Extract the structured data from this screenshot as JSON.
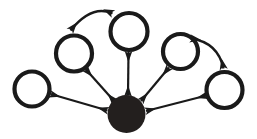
{
  "diagram": {
    "type": "node-link-diagram",
    "canvas": {
      "width": 257,
      "height": 139,
      "background": "#ffffff"
    },
    "style": {
      "ink_color": "#1a1a1a",
      "ring_stroke_width": 4.2,
      "edge_stroke_width": 2.2,
      "curve_stroke_width": 2.4,
      "arrowhead_length": 7,
      "arrowhead_width": 6
    },
    "nodes": [
      {
        "id": "hub",
        "label": "",
        "kind": "filled",
        "fill": "#231f1e",
        "cx": 126.5,
        "cy": 114.0,
        "r": 19.0
      },
      {
        "id": "node-far-left",
        "label": "",
        "kind": "ring",
        "stroke": "#1a1a1a",
        "cx": 32.0,
        "cy": 89.0,
        "r": 17.5
      },
      {
        "id": "node-upper-left",
        "label": "",
        "kind": "ring",
        "stroke": "#1a1a1a",
        "cx": 74.0,
        "cy": 53.5,
        "r": 18.0
      },
      {
        "id": "node-top-center",
        "label": "",
        "kind": "ring",
        "stroke": "#1a1a1a",
        "cx": 129.0,
        "cy": 31.5,
        "r": 18.5
      },
      {
        "id": "node-upper-right",
        "label": "",
        "kind": "ring",
        "stroke": "#1a1a1a",
        "cx": 180.5,
        "cy": 51.5,
        "r": 17.5
      },
      {
        "id": "node-far-right",
        "label": "",
        "kind": "ring",
        "stroke": "#1a1a1a",
        "cx": 224.5,
        "cy": 90.0,
        "r": 18.0
      }
    ],
    "spokes": [
      {
        "id": "spoke-hub-far-left",
        "from": "hub",
        "to": "node-far-left",
        "arrows": "both",
        "x1": 107.5,
        "y1": 110.5,
        "x2": 50.5,
        "y2": 94.0
      },
      {
        "id": "spoke-hub-upper-left",
        "from": "hub",
        "to": "node-upper-left",
        "arrows": "both",
        "x1": 114.5,
        "y1": 101.5,
        "x2": 85.5,
        "y2": 69.0
      },
      {
        "id": "spoke-hub-top-center",
        "from": "hub",
        "to": "node-top-center",
        "arrows": "both",
        "x1": 128.0,
        "y1": 95.5,
        "x2": 128.5,
        "y2": 52.0
      },
      {
        "id": "spoke-hub-upper-right",
        "from": "hub",
        "to": "node-upper-right",
        "arrows": "both",
        "x1": 141.0,
        "y1": 101.0,
        "x2": 169.0,
        "y2": 67.5
      },
      {
        "id": "spoke-hub-far-right",
        "from": "hub",
        "to": "node-far-right",
        "arrows": "both",
        "x1": 146.0,
        "y1": 111.0,
        "x2": 206.5,
        "y2": 95.5
      }
    ],
    "arcs": [
      {
        "id": "arc-upper-left-top-center",
        "from": "node-upper-left",
        "to": "node-top-center",
        "arrows": "both",
        "path": "M 70.5 30.5 Q 92.0 4.0 112.5 13.5"
      },
      {
        "id": "arc-upper-right-far-right",
        "from": "node-upper-right",
        "to": "node-far-right",
        "arrows": "both",
        "path": "M 191.0 38.5 Q 218.0 42.5 223.5 68.5"
      }
    ]
  }
}
